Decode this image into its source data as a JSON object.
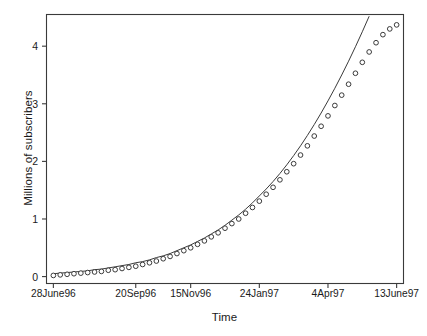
{
  "chart_data": {
    "type": "scatter",
    "title": "",
    "subtitle": "",
    "xlabel": "Time",
    "ylabel": "Millions of subscribers",
    "grid": false,
    "legend": null,
    "legend_position": "none",
    "marker": "open-circle",
    "series_line_label": "fitted exponential curve",
    "series_points_label": "observed subscribers",
    "xtick_labels": [
      "28June96",
      "20Sep96",
      "15Nov96",
      "24Jan97",
      "4Apr97",
      "13June97"
    ],
    "xtick_values": [
      0,
      12,
      20,
      30,
      40,
      50
    ],
    "ytick_labels": [
      "0",
      "1",
      "2",
      "3",
      "4"
    ],
    "ytick_values": [
      0,
      1,
      2,
      3,
      4
    ],
    "xlim": [
      -1,
      51
    ],
    "ylim": [
      -0.12,
      4.55
    ],
    "x_unit": "weeks since 28 June 1996",
    "x": [
      0,
      1,
      2,
      3,
      4,
      5,
      6,
      7,
      8,
      9,
      10,
      11,
      12,
      13,
      14,
      15,
      16,
      17,
      18,
      19,
      20,
      21,
      22,
      23,
      24,
      25,
      26,
      27,
      28,
      29,
      30,
      31,
      32,
      33,
      34,
      35,
      36,
      37,
      38,
      39,
      40,
      41,
      42,
      43,
      44,
      45,
      46,
      47,
      48,
      49,
      50
    ],
    "values": [
      0.02,
      0.03,
      0.04,
      0.05,
      0.06,
      0.07,
      0.08,
      0.09,
      0.11,
      0.12,
      0.14,
      0.16,
      0.18,
      0.21,
      0.24,
      0.27,
      0.31,
      0.35,
      0.4,
      0.45,
      0.5,
      0.56,
      0.62,
      0.69,
      0.76,
      0.84,
      0.92,
      1.0,
      1.1,
      1.2,
      1.31,
      1.43,
      1.55,
      1.68,
      1.82,
      1.96,
      2.11,
      2.27,
      2.44,
      2.61,
      2.79,
      2.97,
      3.15,
      3.34,
      3.53,
      3.72,
      3.9,
      4.06,
      4.2,
      4.3,
      4.37
    ],
    "fit_curve_values": [
      0.05,
      0.06,
      0.07,
      0.08,
      0.09,
      0.1,
      0.12,
      0.13,
      0.15,
      0.17,
      0.19,
      0.21,
      0.24,
      0.26,
      0.29,
      0.33,
      0.36,
      0.4,
      0.45,
      0.5,
      0.55,
      0.61,
      0.67,
      0.74,
      0.81,
      0.89,
      0.98,
      1.07,
      1.17,
      1.28,
      1.4,
      1.52,
      1.65,
      1.79,
      1.94,
      2.1,
      2.27,
      2.45,
      2.64,
      2.84,
      3.05,
      3.27,
      3.5,
      3.74,
      3.99,
      4.25,
      4.52,
      4.8,
      5.09,
      5.39,
      5.7
    ]
  }
}
